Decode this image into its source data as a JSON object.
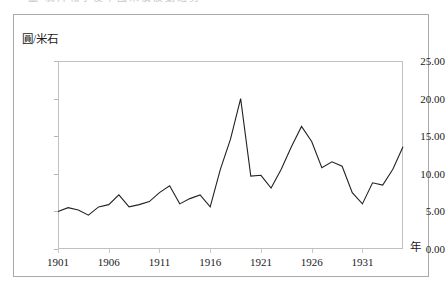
{
  "figure": {
    "top_caption_sliver": "圖 鴉片戰爭後中國米價波動趨勢",
    "y_axis_unit_label": "圓/米石",
    "x_axis_unit_label": "年"
  },
  "chart_data": {
    "type": "line",
    "title": "",
    "subtitle": "",
    "xlabel": "年",
    "ylabel": "圓/米石",
    "ylim": [
      0.0,
      25.0
    ],
    "xlim": [
      1901,
      1935
    ],
    "grid": false,
    "legend": null,
    "legend_position": "none",
    "y_ticks": [
      0.0,
      5.0,
      10.0,
      15.0,
      20.0,
      25.0
    ],
    "y_tick_labels": [
      "0.00",
      "5.00",
      "10.00",
      "15.00",
      "20.00",
      "25.00"
    ],
    "x_ticks": [
      1901,
      1906,
      1911,
      1916,
      1921,
      1926,
      1931
    ],
    "x_tick_labels": [
      "1901",
      "1906",
      "1911",
      "1916",
      "1921",
      "1926",
      "1931"
    ],
    "line_color": "#222222",
    "line_width": 1.1,
    "x": [
      1901,
      1902,
      1903,
      1904,
      1905,
      1906,
      1907,
      1908,
      1909,
      1910,
      1911,
      1912,
      1913,
      1914,
      1915,
      1916,
      1917,
      1918,
      1919,
      1920,
      1921,
      1922,
      1923,
      1924,
      1925,
      1926,
      1927,
      1928,
      1929,
      1930,
      1931,
      1932,
      1933,
      1934,
      1935
    ],
    "values": [
      5.0,
      5.5,
      5.2,
      4.5,
      5.6,
      5.9,
      7.2,
      5.6,
      5.9,
      6.3,
      7.5,
      8.4,
      6.0,
      6.7,
      7.2,
      5.6,
      10.6,
      14.6,
      20.0,
      9.7,
      9.8,
      8.1,
      10.6,
      13.6,
      16.3,
      14.3,
      10.8,
      11.6,
      11.0,
      7.5,
      6.0,
      8.8,
      8.5,
      10.6,
      13.6
    ],
    "series": [
      {
        "name": "米價",
        "values": [
          5.0,
          5.5,
          5.2,
          4.5,
          5.6,
          5.9,
          7.2,
          5.6,
          5.9,
          6.3,
          7.5,
          8.4,
          6.0,
          6.7,
          7.2,
          5.6,
          10.6,
          14.6,
          20.0,
          9.7,
          9.8,
          8.1,
          10.6,
          13.6,
          16.3,
          14.3,
          10.8,
          11.6,
          11.0,
          7.5,
          6.0,
          8.8,
          8.5,
          10.6,
          13.6
        ]
      }
    ]
  }
}
